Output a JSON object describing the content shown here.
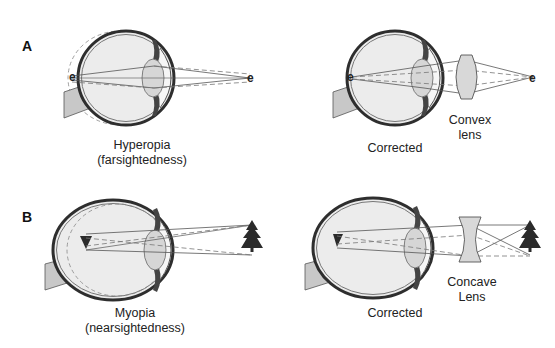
{
  "panels": [
    {
      "id": "A",
      "label": "A",
      "condition": {
        "title": "Hyperopia",
        "subtitle": "(farsightedness)",
        "image_label": "e",
        "object_label": "e"
      },
      "corrected": {
        "title": "Corrected",
        "lens_label_line1": "Convex",
        "lens_label_line2": "lens",
        "image_label": "e",
        "object_label": "e"
      }
    },
    {
      "id": "B",
      "label": "B",
      "condition": {
        "title": "Myopia",
        "subtitle": "(nearsightedness)",
        "object": "tree-icon"
      },
      "corrected": {
        "title": "Corrected",
        "lens_label_line1": "Concave",
        "lens_label_line2": "Lens",
        "object": "tree-icon"
      }
    }
  ],
  "colors": {
    "eye_outline": "#3a3a3a",
    "eye_fill": "#ececec",
    "lens_fill": "#d6d6d6",
    "optic_nerve": "#c8c8c8",
    "ray": "#555555",
    "tree": "#2b2b2b"
  }
}
